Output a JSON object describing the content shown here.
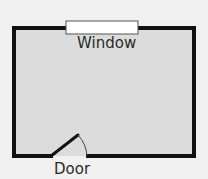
{
  "diagram": {
    "type": "floor-plan",
    "room": {
      "fill": "#dcdcdc",
      "wall_color": "#111111"
    },
    "labels": {
      "window": "Window",
      "door": "Door"
    },
    "colors": {
      "background": "#f1f1f1",
      "window_fill": "#ffffff",
      "window_stroke": "#555555"
    }
  }
}
